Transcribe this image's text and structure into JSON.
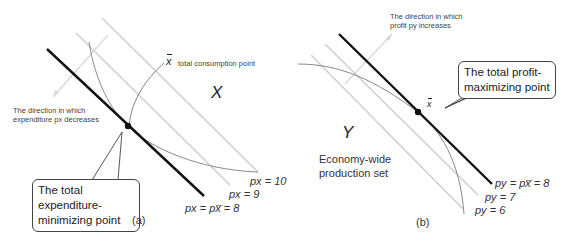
{
  "panel_a": {
    "caption": "(a)",
    "set_label": "X",
    "xbar_label": "x",
    "consumption_point_label": "total consumption point",
    "direction_label_line1": "The direction in which",
    "direction_label_line2": "expenditure px decreases",
    "callout_line1": "The total expenditure-",
    "callout_line2": "minimizing point",
    "lines": [
      {
        "label": "px = px̅ = 8",
        "style": "bold"
      },
      {
        "label": "px = 9",
        "style": "light"
      },
      {
        "label": "px = 10",
        "style": "light"
      }
    ]
  },
  "panel_b": {
    "caption": "(b)",
    "set_label": "Y",
    "set_description_line1": "Economy-wide",
    "set_description_line2": "production set",
    "xbar_label": "x",
    "direction_label_line1": "The direction in which",
    "direction_label_line2": "profit py increases",
    "callout_line1": "The total profit-",
    "callout_line2": "maximizing point",
    "lines": [
      {
        "label": "py = px̅ = 8",
        "style": "bold"
      },
      {
        "label": "py = 7",
        "style": "light"
      },
      {
        "label": "py = 6",
        "style": "light"
      }
    ]
  },
  "colors": {
    "bold_line": "#111111",
    "light_line": "#cfcfcf",
    "curve": "#8a8a8a",
    "text": "#333333"
  }
}
